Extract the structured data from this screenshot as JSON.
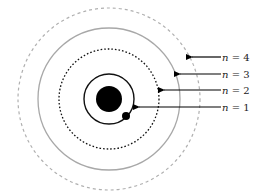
{
  "diagram": {
    "type": "bohr-atom-energy-levels",
    "nucleus": {
      "cx": 109,
      "cy": 99,
      "r": 13,
      "color": "#000000"
    },
    "electron": {
      "cx": 126,
      "cy": 116,
      "r": 4,
      "color": "#000000"
    },
    "orbits": [
      {
        "n": 1,
        "r": 25,
        "style": "solid",
        "color": "#000000"
      },
      {
        "n": 2,
        "r": 50,
        "style": "dotted",
        "color": "#000000"
      },
      {
        "n": 3,
        "r": 71,
        "style": "solid",
        "color": "#a8a8a8"
      },
      {
        "n": 4,
        "r": 91,
        "style": "dashed",
        "color": "#b0b0b0"
      }
    ],
    "labels": [
      {
        "var": "n",
        "eq": " = 4",
        "y": 57,
        "arrow_x1": 221,
        "arrow_x2": 191
      },
      {
        "var": "n",
        "eq": " = 3",
        "y": 74,
        "arrow_x1": 221,
        "arrow_x2": 179
      },
      {
        "var": "n",
        "eq": " = 2",
        "y": 90,
        "arrow_x1": 221,
        "arrow_x2": 163
      },
      {
        "var": "n",
        "eq": " = 1",
        "y": 107,
        "arrow_x1": 221,
        "arrow_x2": 138
      }
    ]
  }
}
